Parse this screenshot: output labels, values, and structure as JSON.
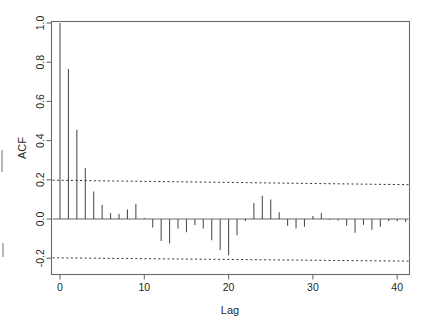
{
  "figure": {
    "type": "acf-plot",
    "background_color": "#ffffff",
    "axis_color": "#555555",
    "spike_color": "#4a4a4a",
    "conf_color": "#333333"
  },
  "axes": {
    "y_title": "ACF",
    "x_title": "Lag",
    "y_ticks": [
      "1.0",
      "0.8",
      "0.6",
      "0.4",
      "0.2",
      "0.0",
      "-0.2"
    ],
    "y_tick_values": [
      1.0,
      0.8,
      0.6,
      0.4,
      0.2,
      0.0,
      -0.2
    ],
    "x_ticks": [
      "0",
      "10",
      "20",
      "30",
      "40"
    ],
    "x_tick_values": [
      0,
      10,
      20,
      30,
      40
    ]
  },
  "chart_data": {
    "type": "bar",
    "title": "",
    "subtitle": "",
    "xlabel": "Lag",
    "ylabel": "ACF",
    "xlim": [
      -1.2,
      42
    ],
    "ylim": [
      -0.28,
      1.05
    ],
    "grid": false,
    "legend": null,
    "categories": [
      0,
      1,
      2,
      3,
      4,
      5,
      6,
      7,
      8,
      9,
      10,
      11,
      12,
      13,
      14,
      15,
      16,
      17,
      18,
      19,
      20,
      21,
      22,
      23,
      24,
      25,
      26,
      27,
      28,
      29,
      30,
      31,
      32,
      33,
      34,
      35,
      36,
      37,
      38,
      39,
      40,
      41
    ],
    "values": [
      1.0,
      0.765,
      0.455,
      0.26,
      0.14,
      0.073,
      0.03,
      0.027,
      0.048,
      0.078,
      0.005,
      -0.043,
      -0.112,
      -0.125,
      -0.048,
      -0.068,
      -0.03,
      -0.048,
      -0.108,
      -0.158,
      -0.185,
      -0.083,
      -0.01,
      0.082,
      0.118,
      0.1,
      0.035,
      -0.035,
      -0.048,
      -0.04,
      0.015,
      0.03,
      -0.005,
      -0.008,
      -0.035,
      -0.07,
      -0.03,
      -0.055,
      -0.04,
      -0.012,
      -0.012,
      -0.015
    ],
    "confidence_band": {
      "upper_start": 0.198,
      "upper_end": 0.175,
      "lower_start": -0.198,
      "lower_end": -0.215,
      "style": "dotted"
    }
  }
}
